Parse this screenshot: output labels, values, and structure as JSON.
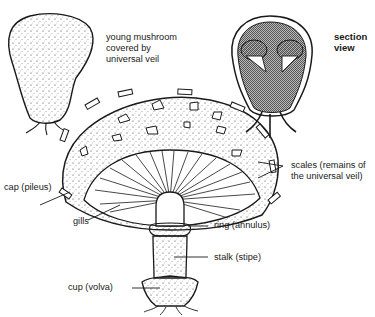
{
  "diagram": {
    "labels": {
      "young": [
        "young mushroom",
        "covered by",
        "universal veil"
      ],
      "section": [
        "section",
        "view"
      ],
      "scales": [
        "scales (remains of",
        "the universal veil)"
      ],
      "cap": "cap (pileus)",
      "gills": "gills",
      "ring": "ring (annulus)",
      "stalk": "stalk (stipe)",
      "cup": "cup (volva)"
    },
    "colors": {
      "ink": "#1a1a1a",
      "background": "#ffffff",
      "section_fill": "#9a9a9a"
    }
  }
}
